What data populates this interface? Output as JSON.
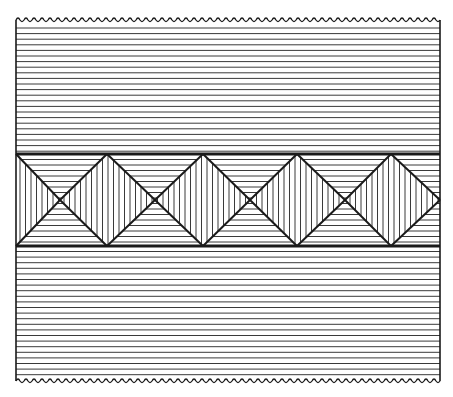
{
  "figure": {
    "title": "Hatched textile pattern with diamond band",
    "width": 453,
    "height": 397,
    "colors": {
      "ink": "#1a1a1a",
      "paper": "#ffffff",
      "hatch": "#3a3a3a"
    },
    "frame": {
      "left": 16,
      "right": 440,
      "top": 20,
      "bottom": 381
    },
    "field_hatch_spacing": 5.6,
    "band": {
      "top": 154,
      "bottom": 246,
      "centers_x": [
        60,
        155,
        250,
        345
      ],
      "peaks_x": [
        107,
        203,
        297,
        391
      ],
      "right_tip_x": 440,
      "hatch_spacing": 5.5
    }
  }
}
